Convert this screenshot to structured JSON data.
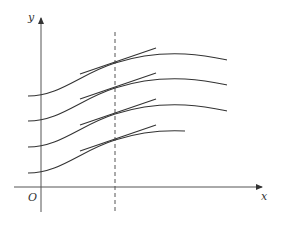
{
  "diagram": {
    "axes": {
      "x_label": "x",
      "y_label": "y",
      "origin_label": "O"
    },
    "curves": [
      {
        "name": "curve-1",
        "offset": 0
      },
      {
        "name": "curve-2",
        "offset": 25
      },
      {
        "name": "curve-3",
        "offset": 51
      },
      {
        "name": "curve-4",
        "offset": 77
      }
    ],
    "colors": {
      "line": "#333333",
      "axis": "#555555"
    }
  }
}
